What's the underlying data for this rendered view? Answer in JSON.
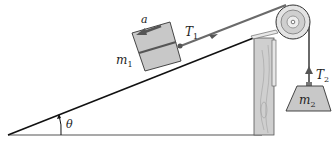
{
  "diagram": {
    "labels": {
      "acceleration": "a",
      "mass1": "m",
      "mass1_sub": "1",
      "tension1": "T",
      "tension1_sub": "1",
      "tension2": "T",
      "tension2_sub": "2",
      "mass2": "m",
      "mass2_sub": "2",
      "angle": "θ"
    },
    "colors": {
      "line": "#111111",
      "block_fill": "#c8c8c8",
      "rope": "#6a6a6a",
      "arrow": "#555555",
      "wood": "#cfcfcf",
      "pulley": "#d8d8d8"
    }
  }
}
